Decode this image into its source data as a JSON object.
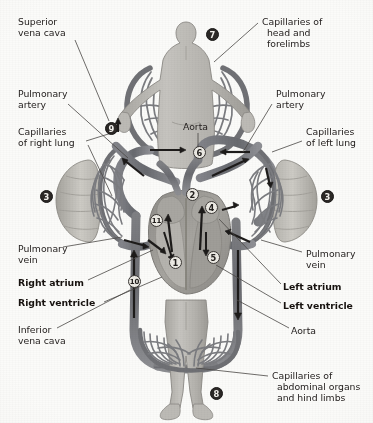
{
  "labels": [
    {
      "id": "superior-vena-cava",
      "lines": [
        "Superior",
        "vena cava"
      ],
      "bold": false,
      "x": 18,
      "y": 16
    },
    {
      "id": "pulmonary-artery-left",
      "lines": [
        "Pulmonary",
        "artery"
      ],
      "bold": false,
      "x": 18,
      "y": 88
    },
    {
      "id": "capillaries-right-lung",
      "lines": [
        "Capillaries",
        "of right lung"
      ],
      "bold": false,
      "x": 18,
      "y": 126
    },
    {
      "id": "pulmonary-vein-left",
      "lines": [
        "Pulmonary",
        "vein"
      ],
      "bold": false,
      "x": 18,
      "y": 243
    },
    {
      "id": "right-atrium",
      "lines": [
        "Right atrium"
      ],
      "bold": true,
      "x": 18,
      "y": 277
    },
    {
      "id": "right-ventricle",
      "lines": [
        "Right ventricle"
      ],
      "bold": true,
      "x": 18,
      "y": 297
    },
    {
      "id": "inferior-vena-cava",
      "lines": [
        "Inferior",
        "vena cava"
      ],
      "bold": false,
      "x": 18,
      "y": 324
    },
    {
      "id": "capillaries-head-forelimbs",
      "lines": [
        "Capillaries of",
        "head and",
        "forelimbs"
      ],
      "bold": false,
      "x": 262,
      "y": 16
    },
    {
      "id": "pulmonary-artery-right",
      "lines": [
        "Pulmonary",
        "artery"
      ],
      "bold": false,
      "x": 276,
      "y": 88
    },
    {
      "id": "capillaries-left-lung",
      "lines": [
        "Capillaries",
        "of left lung"
      ],
      "bold": false,
      "x": 306,
      "y": 126
    },
    {
      "id": "pulmonary-vein-right",
      "lines": [
        "Pulmonary",
        "vein"
      ],
      "bold": false,
      "x": 306,
      "y": 248
    },
    {
      "id": "left-atrium",
      "lines": [
        "Left atrium"
      ],
      "bold": true,
      "x": 283,
      "y": 281
    },
    {
      "id": "left-ventricle",
      "lines": [
        "Left ventricle"
      ],
      "bold": true,
      "x": 283,
      "y": 300
    },
    {
      "id": "aorta-lower",
      "lines": [
        "Aorta"
      ],
      "bold": false,
      "x": 291,
      "y": 325
    },
    {
      "id": "aorta-upper",
      "lines": [
        "Aorta"
      ],
      "bold": false,
      "x": 183,
      "y": 121
    },
    {
      "id": "capillaries-abdominal",
      "lines": [
        "Capillaries of",
        "abdominal organs",
        "and hind limbs"
      ],
      "bold": false,
      "x": 272,
      "y": 370
    }
  ],
  "markers": [
    {
      "id": "marker-1",
      "value": "1",
      "style": "open",
      "x": 175,
      "y": 262
    },
    {
      "id": "marker-2",
      "value": "2",
      "style": "open",
      "x": 192,
      "y": 194
    },
    {
      "id": "marker-3-right-lung",
      "value": "3",
      "style": "solid",
      "x": 46,
      "y": 196
    },
    {
      "id": "marker-3-left-lung",
      "value": "3",
      "style": "solid",
      "x": 327,
      "y": 196
    },
    {
      "id": "marker-4",
      "value": "4",
      "style": "open",
      "x": 211,
      "y": 207
    },
    {
      "id": "marker-5",
      "value": "5",
      "style": "open",
      "x": 213,
      "y": 257
    },
    {
      "id": "marker-6",
      "value": "6",
      "style": "open",
      "x": 199,
      "y": 152
    },
    {
      "id": "marker-7",
      "value": "7",
      "style": "solid",
      "x": 212,
      "y": 34
    },
    {
      "id": "marker-8",
      "value": "8",
      "style": "solid",
      "x": 216,
      "y": 393
    },
    {
      "id": "marker-9",
      "value": "9",
      "style": "solid",
      "x": 111,
      "y": 128
    },
    {
      "id": "marker-10",
      "value": "10",
      "style": "open",
      "x": 134,
      "y": 281
    },
    {
      "id": "marker-11",
      "value": "11",
      "style": "open",
      "x": 156,
      "y": 220
    }
  ],
  "colors": {
    "background": "#fbfbf9",
    "vessel_dark": "#6d6e72",
    "vessel_mid": "#85868a",
    "vessel_light": "#a9a8a6",
    "body_fill": "#b9b7b2",
    "lung_fill": "#c2c0ba",
    "heart_inner": "#9a9894",
    "leader_line": "#4a4745",
    "text": "#262221"
  },
  "leaders": [
    {
      "id": "leader-superior-vena-cava",
      "x1": 75,
      "y1": 40,
      "x2": 109,
      "y2": 121
    },
    {
      "id": "leader-pulmonary-artery-left",
      "x1": 68,
      "y1": 104,
      "x2": 128,
      "y2": 158
    },
    {
      "id": "leader-capillaries-right-lung",
      "x1": 85,
      "y1": 140,
      "x2": 118,
      "y2": 131
    },
    {
      "id": "leader-capillaries-right-lung2",
      "x1": 85,
      "y1": 143,
      "x2": 112,
      "y2": 196
    },
    {
      "id": "leader-pulmonary-vein-left",
      "x1": 63,
      "y1": 247,
      "x2": 120,
      "y2": 237
    },
    {
      "id": "leader-right-atrium",
      "x1": 85,
      "y1": 280,
      "x2": 153,
      "y2": 250
    },
    {
      "id": "leader-right-ventricle",
      "x1": 100,
      "y1": 302,
      "x2": 160,
      "y2": 277
    },
    {
      "id": "leader-inferior-vena-cava",
      "x1": 56,
      "y1": 328,
      "x2": 130,
      "y2": 290
    },
    {
      "id": "leader-capillaries-head",
      "x1": 258,
      "y1": 22,
      "x2": 214,
      "y2": 62
    },
    {
      "id": "leader-pulmonary-artery-right",
      "x1": 272,
      "y1": 104,
      "x2": 243,
      "y2": 152
    },
    {
      "id": "leader-capillaries-left-lung",
      "x1": 302,
      "y1": 140,
      "x2": 272,
      "y2": 152
    },
    {
      "id": "leader-pulmonary-vein-right",
      "x1": 302,
      "y1": 252,
      "x2": 261,
      "y2": 240
    },
    {
      "id": "leader-left-atrium",
      "x1": 280,
      "y1": 284,
      "x2": 219,
      "y2": 219
    },
    {
      "id": "leader-left-ventricle",
      "x1": 280,
      "y1": 303,
      "x2": 216,
      "y2": 265
    },
    {
      "id": "leader-aorta-lower",
      "x1": 288,
      "y1": 328,
      "x2": 237,
      "y2": 300
    },
    {
      "id": "leader-aorta-upper",
      "x1": 198,
      "y1": 133,
      "x2": 198,
      "y2": 148
    },
    {
      "id": "leader-capillaries-abdominal",
      "x1": 268,
      "y1": 375,
      "x2": 196,
      "y2": 368
    }
  ]
}
